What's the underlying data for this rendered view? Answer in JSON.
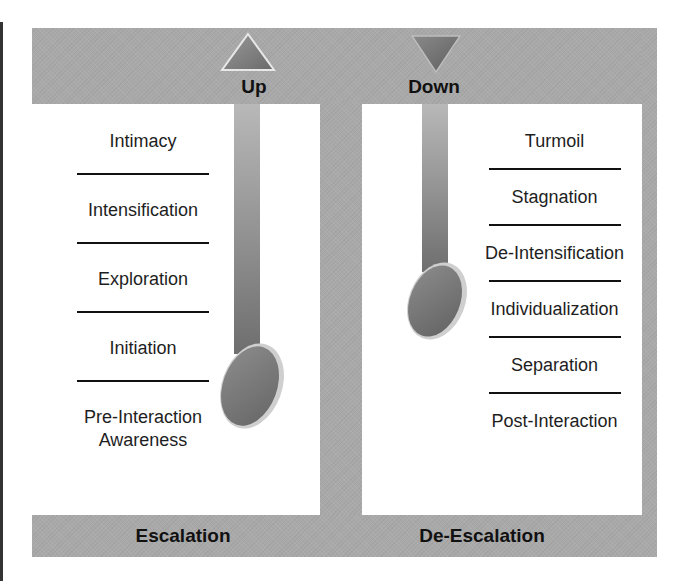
{
  "diagram": {
    "top_bar": {
      "up_label": "Up",
      "down_label": "Down",
      "up_icon": "triangle-up-icon",
      "down_icon": "triangle-down-icon"
    },
    "bottom_bar": {
      "left_label": "Escalation",
      "right_label": "De-Escalation"
    },
    "escalation_stages": [
      "Intimacy",
      "Intensification",
      "Exploration",
      "Initiation",
      "Pre-Interaction",
      "Awareness"
    ],
    "escalation_last_stage": {
      "line1": "Pre-Interaction",
      "line2": "Awareness"
    },
    "deescalation_stages": [
      "Turmoil",
      "Stagnation",
      "De-Intensification",
      "Individualization",
      "Separation",
      "Post-Interaction"
    ],
    "colors": {
      "frame_gray": "#a9a9a9",
      "rod_gray": "#909090",
      "bob_gray": "#7a7a7a",
      "text": "#1e1e1e",
      "background": "#ffffff"
    }
  }
}
